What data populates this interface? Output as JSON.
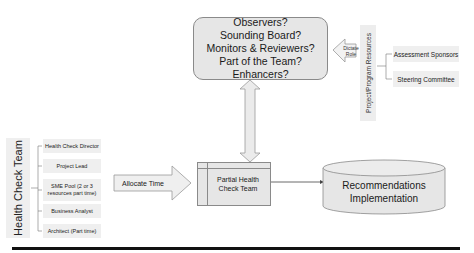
{
  "roles_box": {
    "lines": [
      "Observers?",
      "Sounding Board?",
      "Monitors & Reviewers?",
      "Part of the Team?",
      "Enhancers?"
    ]
  },
  "dictate_arrow": {
    "line1": "Dictate",
    "line2": "Role"
  },
  "project_resources": {
    "label": "Project/Program Resources",
    "items": [
      "Assessment Sponsors",
      "Steering Committee"
    ]
  },
  "health_check_team": {
    "label": "Health Check Team",
    "items": [
      {
        "line1": "Health Check Director",
        "line2": ""
      },
      {
        "line1": "Project Lead",
        "line2": ""
      },
      {
        "line1": "SME Pool (2 or 3",
        "line2": "resources part time)"
      },
      {
        "line1": "Business Analyst",
        "line2": ""
      },
      {
        "line1": "Architect (Part time)",
        "line2": ""
      }
    ]
  },
  "allocate_arrow": {
    "label": "Allocate Time"
  },
  "partial_team": {
    "line1": "Partial Health",
    "line2": "Check Team"
  },
  "recommendations": {
    "line1": "Recommendations",
    "line2": "Implementation"
  },
  "colors": {
    "fill": "#e6e6e6",
    "stroke": "#8a8a8a",
    "divider": "#111111"
  }
}
